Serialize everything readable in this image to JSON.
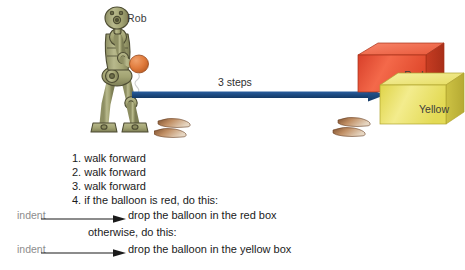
{
  "scene": {
    "robot_name_label": "Rob",
    "distance_label": "3 steps",
    "robot_color": "#a3a472",
    "robot_outline_color": "#4c4b32",
    "balloon_color": "#e07b3c",
    "arrow_color": "#1f4e87",
    "footprint_color": "#9c6b44"
  },
  "boxes": [
    {
      "label": "Red",
      "color": "#ee5a3a",
      "top_color": "#f47b5d",
      "side_color": "#c8432a"
    },
    {
      "label": "Yellow",
      "color": "#e8e05c",
      "top_color": "#efe98a",
      "side_color": "#cfc63f"
    }
  ],
  "instructions": {
    "steps": [
      "1. walk forward",
      "2. walk forward",
      "3. walk forward",
      "4. if the balloon is red, do this:"
    ],
    "branch_true": "drop the balloon in the red box",
    "otherwise": "otherwise, do this:",
    "branch_false": "drop the balloon in the yellow box",
    "indent_annotation": "indent",
    "indent_annotation_color": "#8d8d8d"
  }
}
